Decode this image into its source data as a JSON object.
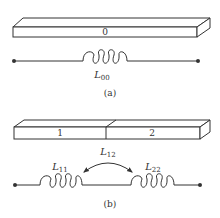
{
  "panel_a": {
    "caption": "(a)",
    "bar": {
      "segment_label": "0"
    },
    "inductor": {
      "symbol": "L",
      "subscript": "00"
    }
  },
  "panel_b": {
    "caption": "(b)",
    "bar": {
      "segment_labels": [
        "1",
        "2"
      ]
    },
    "inductors": [
      {
        "symbol": "L",
        "subscript": "11"
      },
      {
        "symbol": "L",
        "subscript": "22"
      }
    ],
    "mutual": {
      "symbol": "L",
      "subscript": "12"
    }
  },
  "colors": {
    "line": "#333333",
    "background": "#ffffff"
  }
}
